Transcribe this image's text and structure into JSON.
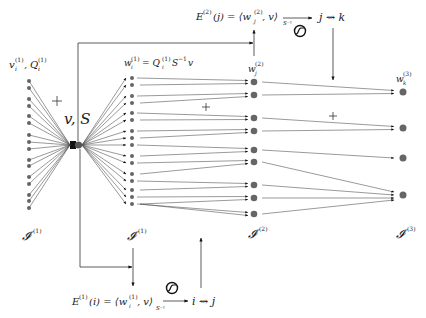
{
  "diagram": {
    "center_node": {
      "label": "v, S"
    },
    "layers": [
      {
        "id": "input",
        "top_label": "v_i^(1), Q_i^(1)",
        "bottom_label": "I^(1)",
        "count": 16
      },
      {
        "id": "layer1",
        "top_label": "w_i^(1) = Q_i^(1) S^-1 v",
        "bottom_label": "I^(1)",
        "count": 16
      },
      {
        "id": "layer2",
        "top_label": "w_j^(2)",
        "bottom_label": "I^(2)",
        "count": 9
      },
      {
        "id": "layer3",
        "top_label": "w_k^(3)",
        "bottom_label": "I^(3)",
        "count": 4
      }
    ],
    "operators": [
      {
        "position": "input-to-center",
        "symbol": "+"
      },
      {
        "position": "layer1-to-layer2",
        "symbol": "+"
      },
      {
        "position": "layer2-to-layer3",
        "symbol": "+"
      }
    ],
    "formulas": {
      "top": {
        "lhs": "E^(2)(j) = ⟨w_j^(2), v⟩_S^-1",
        "selector": "j ⇝ k"
      },
      "bottom": {
        "lhs": "E^(1)(i) = ⟨w_i^(1), v⟩_S^-1",
        "selector": "i ⇝ j"
      }
    },
    "icons": [
      "sigmoid-icon",
      "sigmoid-icon"
    ],
    "labels": {
      "center": "v, S",
      "in_v": "v",
      "in_sup1": "(1)",
      "in_sub_i": "i",
      "in_Q": "Q",
      "w1_lhs": "w",
      "w1_eq": "= Q",
      "w1_rhs": "S",
      "w1_inv": "−1",
      "w1_v": "v",
      "w2": "w",
      "w2_sup": "(2)",
      "w2_sub": "j",
      "w3": "w",
      "w3_sup": "(3)",
      "w3_sub": "k",
      "I": "𝓘",
      "sup1": "(1)",
      "sup2": "(2)",
      "sup3": "(3)",
      "plus": "+",
      "E": "E",
      "top_arg": "(j) = ⟨w",
      "top_tail": ", v⟩",
      "bot_arg": "(i) = ⟨w",
      "bot_tail": ", v⟩",
      "Sinv": "S⁻¹",
      "top_sel": "j ⇝ k",
      "bot_sel": "i ⇝ j",
      "comma": ","
    }
  }
}
